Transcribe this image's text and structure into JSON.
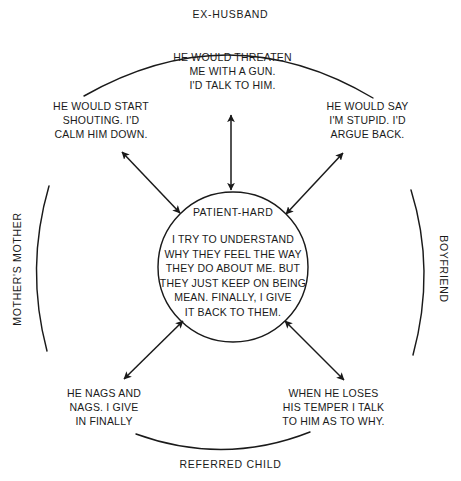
{
  "diagram": {
    "type": "cognitive-interpersonal-cycle",
    "title_present": false,
    "center": {
      "heading": "PATIENT-HARD",
      "body": "I TRY TO UNDERSTAND\nWHY THEY FEEL THE WAY\nTHEY DO ABOUT ME. BUT\nTHEY JUST KEEP ON BEING\nMEAN. FINALLY, I GIVE\nIT BACK TO THEM.",
      "shape": "circle"
    },
    "group_labels": {
      "top": "EX-HUSBAND",
      "bottom": "REFERRED CHILD",
      "left": "MOTHER'S MOTHER",
      "right": "BOYFRIEND"
    },
    "statements": [
      {
        "id": "top",
        "position": "top-center",
        "text": "HE WOULD THREATEN\nME WITH A GUN.\nI'D TALK TO HIM.",
        "related_group": "EX-HUSBAND"
      },
      {
        "id": "top-left",
        "position": "top-left",
        "text": "HE WOULD START\nSHOUTING. I'D\nCALM HIM DOWN.",
        "related_group": "MOTHER'S MOTHER"
      },
      {
        "id": "top-right",
        "position": "top-right",
        "text": "HE WOULD SAY\nI'M STUPID. I'D\nARGUE BACK.",
        "related_group": "BOYFRIEND"
      },
      {
        "id": "bottom-left",
        "position": "bottom-left",
        "text": "HE NAGS AND\nNAGS. I GIVE\nIN FINALLY",
        "related_group": "MOTHER'S MOTHER"
      },
      {
        "id": "bottom-right",
        "position": "bottom-right",
        "text": "WHEN HE LOSES\nHIS TEMPER I TALK\nTO HIM AS TO WHY.",
        "related_group": "REFERRED CHILD"
      }
    ],
    "connectors": [
      {
        "id": "arrow-top",
        "style": "double-headed",
        "from": "center",
        "to": "top"
      },
      {
        "id": "arrow-top-left",
        "style": "double-headed",
        "from": "center",
        "to": "top-left"
      },
      {
        "id": "arrow-top-right",
        "style": "double-headed",
        "from": "center",
        "to": "top-right"
      },
      {
        "id": "arrow-bottom-left",
        "style": "double-headed",
        "from": "center",
        "to": "bottom-left"
      },
      {
        "id": "arrow-bottom-right",
        "style": "double-headed",
        "from": "center",
        "to": "bottom-right"
      }
    ],
    "arcs": [
      {
        "id": "arc-top",
        "label": "EX-HUSBAND"
      },
      {
        "id": "arc-bottom",
        "label": "REFERRED CHILD"
      },
      {
        "id": "arc-left",
        "label": "MOTHER'S MOTHER"
      },
      {
        "id": "arc-right",
        "label": "BOYFRIEND"
      }
    ],
    "colors": {
      "background": "#ffffff",
      "stroke": "#1a1a1a",
      "text": "#1a1a1a"
    }
  }
}
